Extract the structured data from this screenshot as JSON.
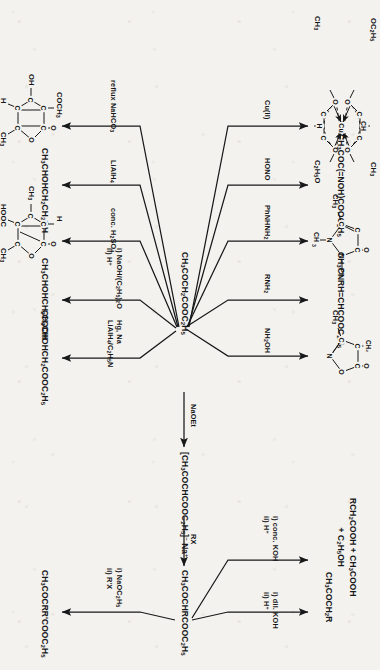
{
  "scheme": {
    "title": "Reactions of ethyl acetoacetate",
    "central_compound": "CH3COCH2COOC2H5",
    "central_compound_html": "CH<sub>3</sub>COCH<sub>2</sub>COOC<sub>2</sub>H<sub>5</sub>",
    "orientation": "rotated-90-clockwise",
    "ink_color": "#17181a",
    "paper_color": "#f4f2ee"
  },
  "chain": {
    "step1_reagent": "NaOEt",
    "step1_product": "[CH3COCHCOOC2H5]- Na+",
    "step1_product_html": "[CH<sub>3</sub>COCHCOOC<sub>2</sub>H<sub>5</sub>]<sup>&ndash;</sup> Na<sup>+</sup>",
    "step2_reagent": "RX",
    "step2_product": "CH3COCHRCOOC2H5",
    "step2_product_html": "CH<sub>3</sub>COCHRCOOC<sub>2</sub>H<sub>5</sub>"
  },
  "branches_up": [
    {
      "id": "cu",
      "reagent": "Cu(II)",
      "reagent_html": "Cu(II)",
      "product_kind": "structure",
      "product_name": "copper(II) bis(ethyl acetoacetate) chelate",
      "labels": [
        "OC2H5",
        "CH",
        "CH3",
        "C2H5O",
        "CH3",
        "H",
        "Cu",
        "O",
        "O",
        "O",
        "O",
        "C",
        "C",
        "C",
        "C",
        "C",
        "C"
      ]
    },
    {
      "id": "hono",
      "reagent": "HONO",
      "reagent_html": "HONO",
      "product_kind": "formula",
      "product": "CH3COC(=NOH)COOC2H5",
      "product_html": "CH<sub>3</sub>COC(=NOH)COOC<sub>2</sub>H<sub>5</sub>"
    },
    {
      "id": "phnhnh2",
      "reagent": "PhNHNH2",
      "reagent_html": "PhNHNH<sub>2</sub>",
      "product_kind": "structure",
      "product_name": "1-phenyl-3-methyl-pyrazol-5-one",
      "labels": [
        "O",
        "C",
        "C",
        "C",
        "N",
        "N",
        "Ph",
        "CH3",
        "CH3"
      ]
    },
    {
      "id": "rnh2",
      "reagent": "RNH2",
      "reagent_html": "RNH<sub>2</sub>",
      "product_kind": "formula",
      "product": "CH3CNRH=CHCOOC2H5",
      "product_html": "CH<sub>3</sub>CNRH=CHCOOC<sub>2</sub>H<sub>5</sub>"
    },
    {
      "id": "nh2oh",
      "reagent": "NH2OH",
      "reagent_html": "NH<sub>2</sub>OH",
      "product_kind": "structure",
      "product_name": "methyl isoxazolone",
      "labels": [
        "O",
        "CH2",
        "C",
        "C",
        "O",
        "N",
        "CH3"
      ]
    }
  ],
  "branches_from_alkylated": [
    {
      "id": "acid-hydrolysis",
      "reagent_lines": [
        "i) conc. KOH",
        "ii) H+"
      ],
      "reagent_html_lines": [
        "i) conc. KOH",
        "ii) H<sup>+</sup>"
      ],
      "product_lines": [
        "RCH2COOH + CH3COOH",
        "+ C2H5OH"
      ],
      "product_html_lines": [
        "RCH<sub>2</sub>COOH + CH<sub>3</sub>COOH",
        "+ C<sub>2</sub>H<sub>5</sub>OH"
      ]
    },
    {
      "id": "ketonic-hydrolysis",
      "reagent_lines": [
        "i) dil. KOH",
        "ii) H+"
      ],
      "reagent_html_lines": [
        "i) dil. KOH",
        "ii) H<sup>+</sup>"
      ],
      "product_lines": [
        "CH3COCH2R"
      ],
      "product_html_lines": [
        "CH<sub>3</sub>COCH<sub>2</sub>R"
      ]
    },
    {
      "id": "dialkylation",
      "reagent_lines": [
        "i) NaOC2H5",
        "ii) R'X"
      ],
      "reagent_html_lines": [
        "i) NaOC<sub>2</sub>H<sub>5</sub>",
        "ii) R'X"
      ],
      "product_lines": [
        "CH3COCRR'COOC2H5"
      ],
      "product_html_lines": [
        "CH<sub>3</sub>COCRR'COOC<sub>2</sub>H<sub>5</sub>"
      ]
    }
  ],
  "branches_down": [
    {
      "id": "nahco3",
      "reagent": "reflux NaHCO3",
      "reagent_html": "reflux NaHCO<sub>3</sub>",
      "product_kind": "structure",
      "product_name": "dehydroacetic acid",
      "labels": [
        "COCH3",
        "O",
        "OH",
        "C",
        "C",
        "C",
        "C",
        "O",
        "H",
        "CH3"
      ]
    },
    {
      "id": "lialh4",
      "reagent": "LiAlH4",
      "reagent_html": "LiAlH<sub>4</sub>",
      "product_kind": "formula",
      "product": "CH3CHOHCH2CH2OH",
      "product_html": "CH<sub>3</sub>CHOHCH<sub>2</sub>CH<sub>2</sub>OH"
    },
    {
      "id": "h2so4",
      "reagent": "conc. H2SO4",
      "reagent_html": "conc. H<sub>2</sub>SO<sub>4</sub>",
      "product_kind": "structure",
      "product_name": "isodehydroacetic acid",
      "labels": [
        "H",
        "O",
        "CH3",
        "C",
        "C",
        "C",
        "C",
        "O",
        "HOOC",
        "CH3"
      ]
    },
    {
      "id": "naoh",
      "reagent_lines": [
        "i) NaOH/(C2H5)2O",
        "ii) H+"
      ],
      "reagent_html_lines": [
        "i) NaOH/(C<sub>2</sub>H<sub>5</sub>)<sub>2</sub>O",
        "ii) H<sup>+</sup>"
      ],
      "product_kind": "formula",
      "product": "CH3CHOHCH2COOH",
      "product_html": "CH<sub>3</sub>CHOHCH<sub>2</sub>COOH"
    },
    {
      "id": "hgna",
      "reagent_lines": [
        "Hg, Na",
        "LiAlH4/C2H5N"
      ],
      "reagent_html_lines": [
        "Hg, Na",
        "LiAlH<sub>4</sub>/C<sub>2</sub>H<sub>5</sub>N"
      ],
      "product_kind": "formula",
      "product": "CH3CHOHCH2COOC2H5",
      "product_html": "CH<sub>3</sub>CHOHCH<sub>2</sub>COOC<sub>2</sub>H<sub>5</sub>"
    }
  ]
}
